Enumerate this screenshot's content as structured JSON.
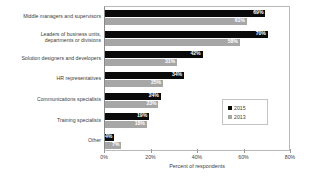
{
  "chart_data": {
    "type": "bar",
    "orientation": "horizontal",
    "title": "",
    "subtitle": "",
    "xlabel": "Percent of respondents",
    "ylabel": "",
    "xlim": [
      0,
      80
    ],
    "xticks": [
      "0%",
      "20%",
      "40%",
      "60%",
      "80%"
    ],
    "xtick_values": [
      0,
      20,
      40,
      60,
      80
    ],
    "grid": false,
    "legend_position": "middle-right",
    "categories": [
      "Middle managers and supervisors",
      "Leaders of business units, departments or divisions",
      "Solution designers and developers",
      "HR representatives",
      "Communications specialists",
      "Training specialists",
      "Other"
    ],
    "series": [
      {
        "name": "2015",
        "color": "#0a0a0a",
        "values": [
          69,
          70,
          42,
          34,
          24,
          19,
          4
        ],
        "labels": [
          "69%",
          "70%",
          "42%",
          "34%",
          "24%",
          "19%",
          "4%"
        ]
      },
      {
        "name": "2013",
        "color": "#a6a6a6",
        "values": [
          61,
          58,
          31,
          25,
          23,
          18,
          7
        ],
        "labels": [
          "61%",
          "58%",
          "31%",
          "25%",
          "23%",
          "18%",
          "7%"
        ]
      }
    ]
  },
  "legend": {
    "items": [
      {
        "label": "2015",
        "color": "#0a0a0a"
      },
      {
        "label": "2013",
        "color": "#a6a6a6"
      }
    ]
  }
}
